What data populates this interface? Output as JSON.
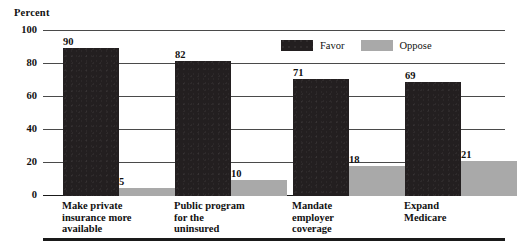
{
  "chart_data": {
    "type": "bar",
    "title": "",
    "subtitle": "",
    "xlabel": "",
    "ylabel": "Percent",
    "ylim": [
      0,
      100
    ],
    "yticks": [
      0,
      20,
      40,
      60,
      80,
      100
    ],
    "grid": true,
    "legend_position": "top-right-inside",
    "categories": [
      "Make private\ninsurance more\navailable",
      "Public program\nfor the\nuninsured",
      "Mandate\nemployer\ncoverage",
      "Expand\nMedicare"
    ],
    "series": [
      {
        "name": "Favor",
        "color": "#231f20",
        "values": [
          90,
          82,
          71,
          69
        ]
      },
      {
        "name": "Oppose",
        "color": "#a9a9a9",
        "values": [
          5,
          10,
          18,
          21
        ]
      }
    ]
  },
  "colors": {
    "favor": "#231f20",
    "oppose": "#a9a9a9",
    "gridline": "#4a4a4a",
    "axis": "#1a1a1a",
    "background": "#ffffff",
    "text": "#111111"
  }
}
